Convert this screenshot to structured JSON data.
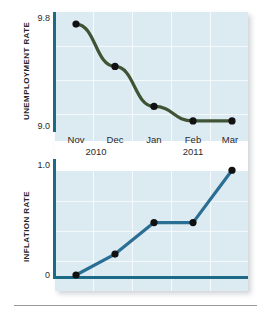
{
  "figure": {
    "background_color": "#ffffff",
    "plot_background_color": "#dceaf2",
    "axis_color": "#1d6a86",
    "rule_color": "#9a9a9a"
  },
  "chart_data": [
    {
      "type": "line",
      "title": "",
      "ylabel": "UNEMPLOYMENT RATE",
      "xlabel": "",
      "series_name": "Unemployment Rate",
      "color": "#3f5434",
      "marker_color": "#111111",
      "categories": [
        "Nov",
        "Dec",
        "Jan",
        "Feb",
        "Mar"
      ],
      "x": [
        "Nov 2010",
        "Dec 2010",
        "Jan 2011",
        "Feb 2011",
        "Mar 2011"
      ],
      "values": [
        9.8,
        9.45,
        9.12,
        9.0,
        9.0
      ],
      "ylim": [
        8.95,
        9.85
      ],
      "yticks": [
        "9.8",
        "9.0"
      ],
      "ytick_values": [
        9.8,
        9.0
      ],
      "grid": true,
      "legend": "none"
    },
    {
      "type": "line",
      "title": "",
      "ylabel": "INFLATION RATE",
      "xlabel": "",
      "series_name": "Inflation Rate",
      "color": "#2b6e93",
      "marker_color": "#111111",
      "categories": [
        "Nov",
        "Dec",
        "Jan",
        "Feb",
        "Mar"
      ],
      "x": [
        "Nov 2010",
        "Dec 2010",
        "Jan 2011",
        "Feb 2011",
        "Mar 2011"
      ],
      "values": [
        0.0,
        0.2,
        0.5,
        0.5,
        1.0
      ],
      "ylim": [
        0.0,
        1.05
      ],
      "yticks": [
        "1.0",
        "0"
      ],
      "ytick_values": [
        1.0,
        0.0
      ],
      "grid": true,
      "legend": "none"
    }
  ],
  "axes": {
    "top": {
      "label": "UNEMPLOYMENT RATE",
      "tick_high": "9.8",
      "tick_low": "9.0"
    },
    "bottom": {
      "label": "INFLATION RATE",
      "tick_high": "1.0",
      "tick_low": "0"
    }
  },
  "xaxis": {
    "months": [
      "Nov",
      "Dec",
      "Jan",
      "Feb",
      "Mar"
    ],
    "years": [
      "2010",
      "2011"
    ]
  }
}
